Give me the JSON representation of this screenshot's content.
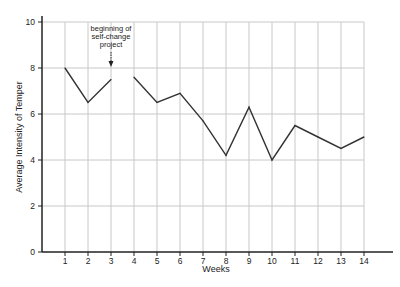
{
  "chart_data": {
    "type": "line",
    "title": "",
    "xlabel": "Weeks",
    "ylabel": "Average Intensity of Temper",
    "x": [
      1,
      2,
      3,
      4,
      5,
      6,
      7,
      8,
      9,
      10,
      11,
      12,
      13,
      14
    ],
    "x_ticks": [
      "1",
      "2",
      "3",
      "4",
      "5",
      "6",
      "7",
      "8",
      "9",
      "10",
      "11",
      "12",
      "13",
      "14"
    ],
    "y_ticks": [
      "0",
      "2",
      "4",
      "6",
      "8",
      "10"
    ],
    "ylim": [
      0,
      10
    ],
    "xlim": [
      0,
      15
    ],
    "grid": true,
    "series": [
      {
        "name": "before",
        "x": [
          1,
          2,
          3
        ],
        "values": [
          8.0,
          6.5,
          7.5
        ]
      },
      {
        "name": "after",
        "x": [
          4,
          5,
          6,
          7,
          8,
          9,
          10,
          11,
          12,
          13,
          14
        ],
        "values": [
          7.6,
          6.5,
          6.9,
          5.7,
          4.2,
          6.3,
          4.0,
          5.5,
          5.0,
          4.5,
          5.0
        ]
      }
    ],
    "annotations": [
      {
        "text_lines": [
          "beginning of",
          "self-change",
          "project"
        ],
        "x": 3,
        "arrow": "down"
      }
    ]
  }
}
